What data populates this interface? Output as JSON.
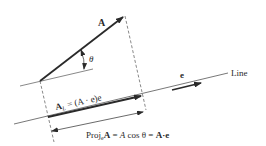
{
  "diagram": {
    "labels": {
      "vector_a": "A",
      "angle": "θ",
      "unit_vector": "e",
      "line": "Line",
      "a_l_main": "A",
      "a_l_sub": "L",
      "a_l_rest": " = (A · e)e",
      "proj_prefix": "Proj",
      "proj_sub": "e",
      "proj_bold": "A",
      "proj_eq1": " = ",
      "proj_italic": "A",
      "proj_cos": " cos θ = ",
      "proj_dot": "A·e"
    },
    "colors": {
      "ink": "#2a2a2a",
      "thin": "#555555",
      "background": "#ffffff"
    }
  }
}
